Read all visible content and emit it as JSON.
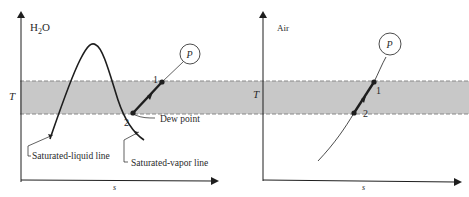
{
  "colors": {
    "band": "#c8c8c8",
    "line": "#1e1e1e",
    "background": "#ffffff"
  },
  "left_panel": {
    "substance_label": "H",
    "substance_subscript": "2",
    "substance_suffix": "O",
    "y_axis_label": "T",
    "x_axis_label": "s",
    "state_circle_label": "P",
    "point_1_label": "1",
    "point_2_label": "2",
    "dew_point_label": "Dew point",
    "saturated_liquid_label": "Saturated-liquid line",
    "saturated_vapor_label": "Saturated-vapor line"
  },
  "right_panel": {
    "substance_label": "Air",
    "y_axis_label": "T",
    "x_axis_label": "s",
    "state_circle_label": "P",
    "point_1_label": "1",
    "point_2_label": "2"
  }
}
